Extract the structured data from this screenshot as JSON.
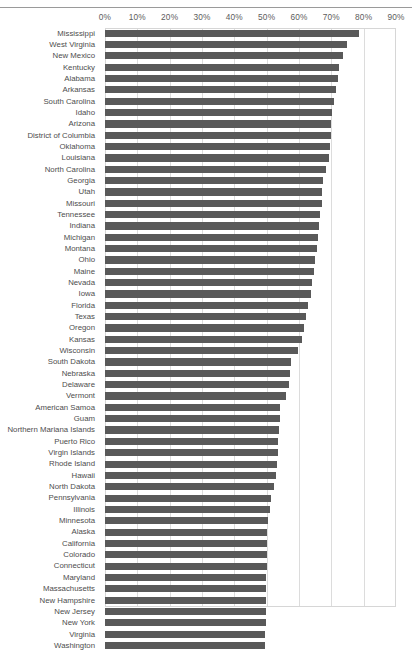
{
  "chart_data": {
    "type": "bar",
    "orientation": "horizontal",
    "title": "",
    "subtitle": "",
    "xlabel": "",
    "ylabel": "",
    "xlim": [
      0,
      90
    ],
    "xtick_labels": [
      "0%",
      "10%",
      "20%",
      "30%",
      "40%",
      "50%",
      "60%",
      "70%",
      "80%",
      "90%"
    ],
    "xtick_values": [
      0,
      10,
      20,
      30,
      40,
      50,
      60,
      70,
      80,
      90
    ],
    "grid": true,
    "grid_axis": "x",
    "legend": false,
    "legend_position": "none",
    "bar_color": "#595959",
    "gridline_color": "#dcdcdc",
    "axis_label_color": "#5c5c5c",
    "category_label_color": "#4d4d4d",
    "sort": "descending",
    "note": "Last category (Washington) is clipped at the bottom edge of the screenshot.",
    "categories": [
      "Mississippi",
      "West Virginia",
      "New Mexico",
      "Kentucky",
      "Alabama",
      "Arkansas",
      "South Carolina",
      "Idaho",
      "Arizona",
      "District of Columbia",
      "Oklahoma",
      "Louisiana",
      "North Carolina",
      "Georgia",
      "Utah",
      "Missouri",
      "Tennessee",
      "Indiana",
      "Michigan",
      "Montana",
      "Ohio",
      "Maine",
      "Nevada",
      "Iowa",
      "Florida",
      "Texas",
      "Oregon",
      "Kansas",
      "Wisconsin",
      "South Dakota",
      "Nebraska",
      "Delaware",
      "Vermont",
      "American Samoa",
      "Guam",
      "Northern Mariana Islands",
      "Puerto Rico",
      "Virgin Islands",
      "Rhode Island",
      "Hawaii",
      "North Dakota",
      "Pennsylvania",
      "Illinois",
      "Minnesota",
      "Alaska",
      "California",
      "Colorado",
      "Connecticut",
      "Maryland",
      "Massachusetts",
      "New Hampshire",
      "New Jersey",
      "New York",
      "Virginia",
      "Washington"
    ],
    "values": [
      78.6,
      74.9,
      73.6,
      72.4,
      72.2,
      71.3,
      70.8,
      70.3,
      69.9,
      69.8,
      69.5,
      69.2,
      68.3,
      67.4,
      67.2,
      67.0,
      66.6,
      66.3,
      65.8,
      65.5,
      65.1,
      64.6,
      64.1,
      63.6,
      62.8,
      62.2,
      61.6,
      61.0,
      59.6,
      57.4,
      57.1,
      56.8,
      55.9,
      54.2,
      54.0,
      53.8,
      53.6,
      53.4,
      53.2,
      52.9,
      52.4,
      51.3,
      50.9,
      50.3,
      50.2,
      50.1,
      50.1,
      50.0,
      49.9,
      49.9,
      49.8,
      49.8,
      49.7,
      49.6,
      49.5
    ]
  }
}
